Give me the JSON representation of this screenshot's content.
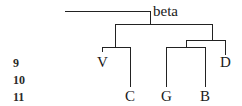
{
  "diagram": {
    "type": "stemma-tree",
    "root": {
      "label": "beta"
    },
    "row_numbers": [
      "9",
      "10",
      "11"
    ],
    "nodes": [
      {
        "id": "V",
        "label": "V",
        "level_row": "9"
      },
      {
        "id": "C",
        "label": "C",
        "level_row": "11"
      },
      {
        "id": "G",
        "label": "G",
        "level_row": "11"
      },
      {
        "id": "B",
        "label": "B",
        "level_row": "11"
      },
      {
        "id": "D",
        "label": "D",
        "level_row": "9"
      }
    ],
    "edges": [
      [
        "beta",
        "hyparchetype-1"
      ],
      [
        "beta",
        "hyparchetype-2"
      ],
      [
        "hyparchetype-1",
        "V"
      ],
      [
        "hyparchetype-1",
        "C"
      ],
      [
        "hyparchetype-2",
        "hyparchetype-3"
      ],
      [
        "hyparchetype-2",
        "D"
      ],
      [
        "hyparchetype-3",
        "G"
      ],
      [
        "hyparchetype-3",
        "B"
      ]
    ],
    "line_color": "#222222"
  }
}
